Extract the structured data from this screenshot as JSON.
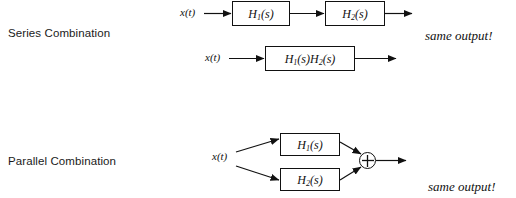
{
  "figure": {
    "title_series": "Series Combination",
    "title_parallel": "Parallel Combination",
    "note_top": "same output!",
    "note_bottom": "same output!",
    "ink_color": "#111111",
    "background_color": "#ffffff"
  },
  "series": {
    "row1": {
      "input_label": "x(t)",
      "block1": {
        "h": "H",
        "sub": "1",
        "arg": "(s)"
      },
      "block2": {
        "h": "H",
        "sub": "2",
        "arg": "(s)"
      }
    },
    "row2": {
      "input_label": "x(t)",
      "block": {
        "h1": "H",
        "sub1": "1",
        "arg1": "(s)",
        "h2": "H",
        "sub2": "2",
        "arg2": "(s)"
      }
    }
  },
  "parallel": {
    "input_label": "x(t)",
    "branch_top": {
      "h": "H",
      "sub": "1",
      "arg": "(s)"
    },
    "branch_bottom": {
      "h": "H",
      "sub": "2",
      "arg": "(s)"
    },
    "summing_junction": {
      "symbol": "+",
      "name": "adder"
    }
  }
}
